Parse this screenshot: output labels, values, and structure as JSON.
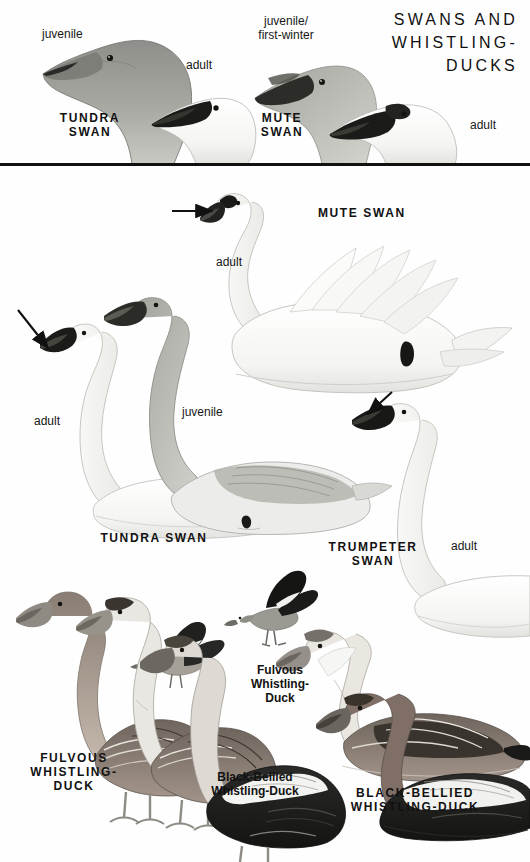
{
  "plate": {
    "title_lines": [
      "SWANS AND",
      "WHISTLING-",
      "DUCKS"
    ],
    "divider": true
  },
  "header_panel": {
    "labels": [
      {
        "id": "tundra-juvenile-age",
        "text": "juvenile",
        "style": "reg"
      },
      {
        "id": "tundra-adult-age",
        "text": "adult",
        "style": "reg"
      },
      {
        "id": "tundra-species-name",
        "text": "TUNDRA\nSWAN",
        "style": "caps"
      },
      {
        "id": "mute-juvenile-age",
        "text": "juvenile/\nfirst-winter",
        "style": "reg"
      },
      {
        "id": "mute-species-name",
        "text": "MUTE\nSWAN",
        "style": "caps"
      },
      {
        "id": "mute-adult-age",
        "text": "adult",
        "style": "reg"
      }
    ]
  },
  "main_panel": {
    "labels": [
      {
        "id": "mute-swan-adult-age",
        "text": "adult",
        "style": "reg"
      },
      {
        "id": "mute-swan-species-name",
        "text": "MUTE SWAN",
        "style": "caps"
      },
      {
        "id": "tundra-swan-adult-age",
        "text": "adult",
        "style": "reg"
      },
      {
        "id": "tundra-swan-juvenile-age",
        "text": "juvenile",
        "style": "reg"
      },
      {
        "id": "tundra-swan-species-name",
        "text": "TUNDRA SWAN",
        "style": "caps"
      },
      {
        "id": "trumpeter-swan-species-name",
        "text": "TRUMPETER\nSWAN",
        "style": "caps"
      },
      {
        "id": "trumpeter-swan-adult-age",
        "text": "adult",
        "style": "reg"
      },
      {
        "id": "fulvous-main-name",
        "text": "FULVOUS\nWHISTLING-\nDUCK",
        "style": "caps"
      },
      {
        "id": "fulvous-flight-name",
        "text": "Fulvous\nWhistling-\nDuck",
        "style": "mixed"
      },
      {
        "id": "black-bellied-flight-name",
        "text": "Black-Bellied\nWhistling-Duck",
        "style": "mixed"
      },
      {
        "id": "black-bellied-main-name",
        "text": "BLACK-BELLIED\nWHISTLING-DUCK",
        "style": "caps"
      }
    ]
  },
  "figures": [
    {
      "id": "tundra-swan-head-juvenile",
      "species": "Tundra Swan",
      "age": "juvenile",
      "view": "head"
    },
    {
      "id": "tundra-swan-head-adult",
      "species": "Tundra Swan",
      "age": "adult",
      "view": "head"
    },
    {
      "id": "mute-swan-head-juvenile",
      "species": "Mute Swan",
      "age": "juvenile/first-winter",
      "view": "head"
    },
    {
      "id": "mute-swan-head-adult",
      "species": "Mute Swan",
      "age": "adult",
      "view": "head"
    },
    {
      "id": "mute-swan-swimming-adult",
      "species": "Mute Swan",
      "age": "adult",
      "view": "swimming"
    },
    {
      "id": "tundra-swan-standing-adult",
      "species": "Tundra Swan",
      "age": "adult",
      "view": "standing"
    },
    {
      "id": "tundra-swan-swimming-juvenile",
      "species": "Tundra Swan",
      "age": "juvenile",
      "view": "swimming"
    },
    {
      "id": "trumpeter-swan-swimming-adult",
      "species": "Trumpeter Swan",
      "age": "adult",
      "view": "swimming"
    },
    {
      "id": "fulvous-whistling-duck-standing-a",
      "species": "Fulvous Whistling-Duck",
      "view": "standing"
    },
    {
      "id": "fulvous-whistling-duck-standing-b",
      "species": "Fulvous Whistling-Duck",
      "view": "standing"
    },
    {
      "id": "black-bellied-whistling-duck-standing",
      "species": "Black-Bellied Whistling-Duck",
      "view": "standing"
    },
    {
      "id": "fulvous-whistling-duck-flight",
      "species": "Fulvous Whistling-Duck",
      "view": "flight"
    },
    {
      "id": "black-bellied-whistling-duck-flight",
      "species": "Black-Bellied Whistling-Duck",
      "view": "flight"
    },
    {
      "id": "fulvous-whistling-duck-swimming",
      "species": "Fulvous Whistling-Duck",
      "view": "swimming"
    },
    {
      "id": "black-bellied-whistling-duck-swimming-a",
      "species": "Black-Bellied Whistling-Duck",
      "view": "swimming"
    },
    {
      "id": "black-bellied-whistling-duck-swimming-b",
      "species": "Black-Bellied Whistling-Duck",
      "view": "swimming"
    }
  ],
  "pointers": [
    {
      "id": "mute-swan-bill-knob-pointer",
      "direction": "right"
    },
    {
      "id": "tundra-swan-bill-pointer",
      "direction": "down-right"
    },
    {
      "id": "trumpeter-swan-bill-pointer",
      "direction": "down-left"
    }
  ],
  "colors": {
    "ink": "#111111",
    "page": "#fefefe",
    "rule": "#111111",
    "juvenile_gray": "#9a9a96",
    "dark_gray": "#5f5f5c",
    "bill_black": "#1b1b1b",
    "feather_light": "#f2f2f0"
  }
}
